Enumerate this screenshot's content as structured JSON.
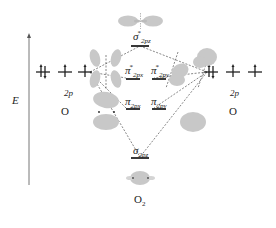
{
  "diagram": {
    "axis_label": "E",
    "left_atom": {
      "symbol": "O",
      "subshell": "2p",
      "electrons": [
        "↑↓",
        "↑",
        "↑"
      ]
    },
    "right_atom": {
      "symbol": "O",
      "subshell": "2p",
      "electrons": [
        "↑↓",
        "↑",
        "↑"
      ]
    },
    "molecule_label": "O",
    "molecule_subscript": "2",
    "molecular_orbitals": [
      {
        "name": "sigma_star_2pz",
        "symbol": "σ",
        "star": "*",
        "subscript": "2pz",
        "type": "antibonding"
      },
      {
        "name": "pi_star_2px",
        "symbol": "π",
        "star": "*",
        "subscript": "2px",
        "type": "antibonding"
      },
      {
        "name": "pi_star_2py",
        "symbol": "π",
        "star": "*",
        "subscript": "2py",
        "type": "antibonding"
      },
      {
        "name": "pi_2px",
        "symbol": "π",
        "star": "",
        "subscript": "2px",
        "type": "bonding"
      },
      {
        "name": "pi_2py",
        "symbol": "π",
        "star": "",
        "subscript": "2py",
        "type": "bonding"
      },
      {
        "name": "sigma_2pz",
        "symbol": "σ",
        "star": "",
        "subscript": "2pz",
        "type": "bonding"
      }
    ],
    "colors": {
      "lobe": "#c8c8c8",
      "line": "#222222",
      "dashed": "#555555"
    }
  }
}
